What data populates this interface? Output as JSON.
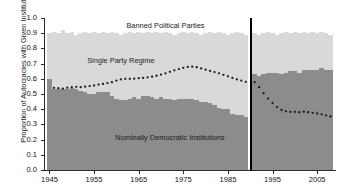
{
  "chart_data": {
    "type": "area",
    "title": "",
    "xlabel": "",
    "ylabel": "Proportion of Autocracies with Given Institutions",
    "xlim": [
      1944,
      2009
    ],
    "ylim": [
      0.0,
      1.0
    ],
    "grid": false,
    "legend_position": "none",
    "break_year": 1990,
    "annotations": [
      {
        "text": "Banned Political Parties",
        "x": 1971,
        "y": 0.95
      },
      {
        "text": "Single Party Regime",
        "x": 1961,
        "y": 0.72
      },
      {
        "text": "Nominally Democratic Institutions",
        "x": 1972,
        "y": 0.21
      }
    ],
    "ytick_labels": [
      "0.0",
      "0.1",
      "0.2",
      "0.3",
      "0.4",
      "0.5",
      "0.6",
      "0.7",
      "0.8",
      "0.9",
      "1.0"
    ],
    "ytick_values": [
      0.0,
      0.1,
      0.2,
      0.3,
      0.4,
      0.5,
      0.6,
      0.7,
      0.8,
      0.9,
      1.0
    ],
    "xtick_labels": [
      "1945",
      "1955",
      "1965",
      "1975",
      "1985",
      "1995",
      "2005"
    ],
    "xtick_values": [
      1945,
      1955,
      1965,
      1975,
      1985,
      1995,
      2005
    ],
    "colors": {
      "nominally_democratic": "#8c8c8c",
      "single_party_band": "#d9d9d9",
      "banned_parties_top": "#ffffff",
      "dotted_line": "#1a1a1a",
      "divider": "#000000",
      "axis": "#2a2a2a"
    },
    "series": [
      {
        "name": "Nominally Democratic Institutions",
        "kind": "stacked-area-bottom",
        "color": "#8c8c8c",
        "x": [
          1945,
          1946,
          1947,
          1948,
          1949,
          1950,
          1951,
          1952,
          1953,
          1954,
          1955,
          1956,
          1957,
          1958,
          1959,
          1960,
          1961,
          1962,
          1963,
          1964,
          1965,
          1966,
          1967,
          1968,
          1969,
          1970,
          1971,
          1972,
          1973,
          1974,
          1975,
          1976,
          1977,
          1978,
          1979,
          1980,
          1981,
          1982,
          1983,
          1984,
          1985,
          1986,
          1987,
          1988,
          1989,
          1990,
          1991,
          1992,
          1993,
          1994,
          1995,
          1996,
          1997,
          1998,
          1999,
          2000,
          2001,
          2002,
          2003,
          2004,
          2005,
          2006,
          2007,
          2008
        ],
        "values": [
          0.6,
          0.53,
          0.53,
          0.53,
          0.53,
          0.54,
          0.53,
          0.52,
          0.51,
          0.5,
          0.5,
          0.51,
          0.51,
          0.51,
          0.49,
          0.47,
          0.46,
          0.46,
          0.47,
          0.48,
          0.47,
          0.49,
          0.49,
          0.48,
          0.47,
          0.48,
          0.47,
          0.47,
          0.46,
          0.47,
          0.47,
          0.47,
          0.47,
          0.46,
          0.45,
          0.45,
          0.44,
          0.43,
          0.41,
          0.4,
          0.4,
          0.37,
          0.36,
          0.36,
          0.35,
          null,
          0.63,
          0.62,
          0.63,
          0.64,
          0.64,
          0.64,
          0.63,
          0.64,
          0.65,
          0.65,
          0.64,
          0.66,
          0.66,
          0.66,
          0.66,
          0.67,
          0.66,
          0.66
        ]
      },
      {
        "name": "Single Party Regime (band)",
        "kind": "stacked-area-middle",
        "color": "#d9d9d9",
        "x": [
          1945,
          1946,
          1947,
          1948,
          1949,
          1950,
          1951,
          1952,
          1953,
          1954,
          1955,
          1956,
          1957,
          1958,
          1959,
          1960,
          1961,
          1962,
          1963,
          1964,
          1965,
          1966,
          1967,
          1968,
          1969,
          1970,
          1971,
          1972,
          1973,
          1974,
          1975,
          1976,
          1977,
          1978,
          1979,
          1980,
          1981,
          1982,
          1983,
          1984,
          1985,
          1986,
          1987,
          1988,
          1989,
          1990,
          1991,
          1992,
          1993,
          1994,
          1995,
          1996,
          1997,
          1998,
          1999,
          2000,
          2001,
          2002,
          2003,
          2004,
          2005,
          2006,
          2007,
          2008
        ],
        "cumulative_top": [
          0.9,
          0.91,
          0.9,
          0.92,
          0.9,
          0.91,
          0.89,
          0.9,
          0.91,
          0.9,
          0.91,
          0.9,
          0.91,
          0.9,
          0.91,
          0.9,
          0.89,
          0.9,
          0.91,
          0.9,
          0.91,
          0.9,
          0.91,
          0.9,
          0.91,
          0.9,
          0.91,
          0.9,
          0.89,
          0.9,
          0.91,
          0.9,
          0.91,
          0.9,
          0.89,
          0.9,
          0.91,
          0.9,
          0.91,
          0.9,
          0.89,
          0.9,
          0.91,
          0.9,
          0.89,
          null,
          0.9,
          0.89,
          0.9,
          0.91,
          0.9,
          0.89,
          0.9,
          0.91,
          0.9,
          0.91,
          0.9,
          0.91,
          0.9,
          0.91,
          0.9,
          0.91,
          0.9,
          0.89
        ]
      },
      {
        "name": "Single Party Regime (dotted)",
        "kind": "dotted-line",
        "color": "#1a1a1a",
        "x": [
          1946,
          1947,
          1948,
          1949,
          1950,
          1951,
          1952,
          1953,
          1954,
          1955,
          1956,
          1957,
          1958,
          1959,
          1960,
          1961,
          1962,
          1963,
          1964,
          1965,
          1966,
          1967,
          1968,
          1969,
          1970,
          1971,
          1972,
          1973,
          1974,
          1975,
          1976,
          1977,
          1978,
          1979,
          1980,
          1981,
          1982,
          1983,
          1984,
          1985,
          1986,
          1987,
          1988,
          1989,
          1991,
          1992,
          1993,
          1994,
          1995,
          1996,
          1997,
          1998,
          1999,
          2000,
          2001,
          2002,
          2003,
          2004,
          2005,
          2006,
          2007,
          2008
        ],
        "values": [
          0.54,
          0.538,
          0.536,
          0.541,
          0.545,
          0.547,
          0.545,
          0.548,
          0.552,
          0.556,
          0.562,
          0.566,
          0.572,
          0.578,
          0.588,
          0.596,
          0.6,
          0.6,
          0.601,
          0.604,
          0.606,
          0.61,
          0.614,
          0.62,
          0.628,
          0.636,
          0.646,
          0.656,
          0.664,
          0.672,
          0.678,
          0.68,
          0.676,
          0.668,
          0.66,
          0.652,
          0.644,
          0.636,
          0.626,
          0.616,
          0.606,
          0.596,
          0.588,
          0.58,
          0.578,
          0.545,
          0.505,
          0.47,
          0.44,
          0.414,
          0.395,
          0.386,
          0.382,
          0.382,
          0.38,
          0.384,
          0.38,
          0.376,
          0.372,
          0.366,
          0.36,
          0.352
        ]
      }
    ]
  },
  "axes": {
    "ylabel": "Proportion of Autocracies with Given Institutions"
  }
}
